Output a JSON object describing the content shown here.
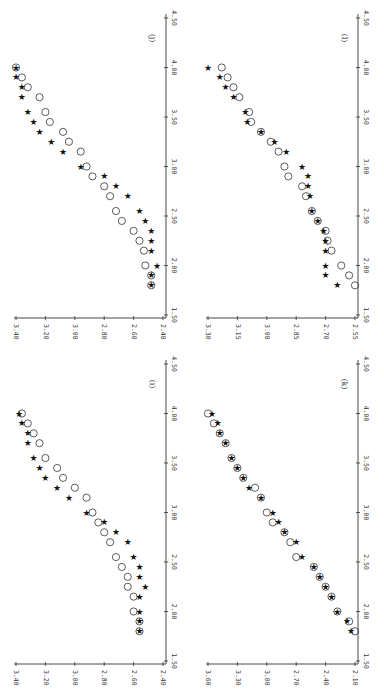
{
  "page": {
    "rotation_deg": 90,
    "layout": "2x2 grid of scatter plots, printed rotated (x-axis vertical on right, y-axis horizontal on bottom)"
  },
  "chart_data": [
    {
      "panel": "(j)",
      "position": "top-left",
      "type": "scatter",
      "x_ticks": [
        "1.50",
        "2.00",
        "2.50",
        "3.00",
        "3.50",
        "4.00",
        "4.50"
      ],
      "y_ticks": [
        "3.40",
        "3.20",
        "3.00",
        "2.80",
        "2.60",
        "2.40"
      ],
      "xlim": [
        1.5,
        4.5
      ],
      "ylim": [
        2.4,
        3.4
      ],
      "x": [
        1.8,
        1.9,
        2.0,
        2.15,
        2.25,
        2.35,
        2.45,
        2.55,
        2.7,
        2.8,
        2.9,
        3.0,
        3.15,
        3.25,
        3.35,
        3.45,
        3.55,
        3.7,
        3.8,
        3.9,
        4.0
      ],
      "series": [
        {
          "name": "circles",
          "marker": "open-circle",
          "values": [
            2.48,
            2.48,
            2.52,
            2.53,
            2.56,
            2.6,
            2.68,
            2.72,
            2.76,
            2.8,
            2.88,
            2.92,
            2.96,
            3.04,
            3.08,
            3.17,
            3.2,
            3.24,
            3.32,
            3.36,
            3.4
          ]
        },
        {
          "name": "stars",
          "marker": "star",
          "values": [
            2.48,
            2.48,
            2.44,
            2.48,
            2.48,
            2.48,
            2.52,
            2.56,
            2.64,
            2.72,
            2.8,
            2.96,
            3.08,
            3.16,
            3.24,
            3.28,
            3.32,
            3.36,
            3.36,
            3.4,
            3.4
          ]
        }
      ]
    },
    {
      "panel": "(l)",
      "position": "top-right",
      "type": "scatter",
      "x_ticks": [
        "1.50",
        "2.00",
        "2.50",
        "3.00",
        "3.50",
        "4.00",
        "4.50"
      ],
      "y_ticks": [
        "3.30",
        "3.15",
        "3.00",
        "2.85",
        "2.70",
        "2.55"
      ],
      "xlim": [
        1.5,
        4.5
      ],
      "ylim": [
        2.55,
        3.3
      ],
      "x": [
        1.8,
        1.9,
        2.0,
        2.15,
        2.25,
        2.35,
        2.45,
        2.55,
        2.7,
        2.8,
        2.9,
        3.0,
        3.15,
        3.25,
        3.35,
        3.45,
        3.55,
        3.7,
        3.8,
        3.9,
        4.0
      ],
      "series": [
        {
          "name": "circles",
          "marker": "open-circle",
          "values": [
            2.55,
            2.58,
            2.62,
            2.67,
            2.69,
            2.7,
            2.74,
            2.77,
            2.8,
            2.82,
            2.89,
            2.91,
            2.94,
            2.98,
            3.03,
            3.08,
            3.09,
            3.14,
            3.17,
            3.2,
            3.23
          ]
        },
        {
          "name": "stars",
          "marker": "star",
          "values": [
            2.64,
            2.7,
            2.7,
            2.7,
            2.7,
            2.71,
            2.74,
            2.77,
            2.78,
            2.79,
            2.79,
            2.82,
            2.9,
            2.96,
            3.03,
            3.1,
            3.11,
            3.17,
            3.21,
            3.24,
            3.3
          ]
        }
      ]
    },
    {
      "panel": "(i)",
      "position": "bottom-left",
      "type": "scatter",
      "x_ticks": [
        "1.50",
        "2.00",
        "2.50",
        "3.00",
        "3.50",
        "4.00",
        "4.50"
      ],
      "y_ticks": [
        "3.40",
        "3.20",
        "3.00",
        "2.80",
        "2.60",
        "2.40"
      ],
      "xlim": [
        1.5,
        4.5
      ],
      "ylim": [
        2.4,
        3.4
      ],
      "x": [
        1.8,
        1.9,
        2.0,
        2.15,
        2.25,
        2.35,
        2.45,
        2.55,
        2.7,
        2.8,
        2.9,
        3.0,
        3.15,
        3.25,
        3.35,
        3.45,
        3.55,
        3.7,
        3.8,
        3.9,
        4.0
      ],
      "series": [
        {
          "name": "circles",
          "marker": "open-circle",
          "values": [
            2.56,
            2.56,
            2.6,
            2.6,
            2.64,
            2.64,
            2.68,
            2.72,
            2.76,
            2.8,
            2.84,
            2.88,
            2.92,
            3.0,
            3.08,
            3.12,
            3.2,
            3.24,
            3.28,
            3.32,
            3.36
          ]
        },
        {
          "name": "stars",
          "marker": "star",
          "values": [
            2.56,
            2.56,
            2.56,
            2.56,
            2.52,
            2.56,
            2.56,
            2.6,
            2.64,
            2.72,
            2.8,
            2.92,
            3.04,
            3.12,
            3.2,
            3.24,
            3.28,
            3.32,
            3.32,
            3.36,
            3.38
          ]
        }
      ]
    },
    {
      "panel": "(k)",
      "position": "bottom-right",
      "type": "scatter",
      "x_ticks": [
        "1.50",
        "2.00",
        "2.50",
        "3.00",
        "3.50",
        "4.00",
        "4.50"
      ],
      "y_ticks": [
        "3.60",
        "3.30",
        "3.00",
        "2.70",
        "2.40",
        "2.10"
      ],
      "xlim": [
        1.5,
        4.5
      ],
      "ylim": [
        2.1,
        3.6
      ],
      "x": [
        1.8,
        1.9,
        2.0,
        2.15,
        2.25,
        2.35,
        2.45,
        2.55,
        2.7,
        2.8,
        2.9,
        3.0,
        3.15,
        3.25,
        3.35,
        3.45,
        3.55,
        3.7,
        3.8,
        3.9,
        4.0
      ],
      "series": [
        {
          "name": "circles",
          "marker": "open-circle",
          "values": [
            2.1,
            2.16,
            2.28,
            2.34,
            2.4,
            2.46,
            2.52,
            2.7,
            2.76,
            2.82,
            2.94,
            3.0,
            3.06,
            3.12,
            3.24,
            3.3,
            3.36,
            3.42,
            3.48,
            3.54,
            3.6
          ]
        },
        {
          "name": "stars",
          "marker": "star",
          "values": [
            2.14,
            2.18,
            2.28,
            2.34,
            2.4,
            2.46,
            2.52,
            2.64,
            2.7,
            2.82,
            2.88,
            2.94,
            3.06,
            3.18,
            3.24,
            3.3,
            3.36,
            3.42,
            3.48,
            3.5,
            3.56
          ]
        }
      ]
    }
  ]
}
